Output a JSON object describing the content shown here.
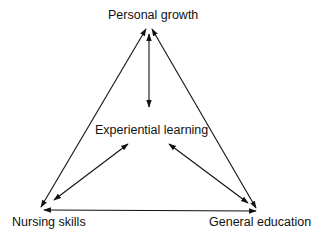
{
  "diagram": {
    "type": "triangle-relationship",
    "nodes": {
      "top": "Personal growth",
      "center": "Experiential learning",
      "bottom_left": "Nursing skills",
      "bottom_right": "General education"
    },
    "edges": [
      {
        "from": "Personal growth",
        "to": "Nursing skills",
        "style": "double-arrow"
      },
      {
        "from": "Personal growth",
        "to": "General education",
        "style": "double-arrow"
      },
      {
        "from": "Nursing skills",
        "to": "General education",
        "style": "double-arrow"
      },
      {
        "from": "Experiential learning",
        "to": "Personal growth",
        "style": "double-arrow"
      },
      {
        "from": "Experiential learning",
        "to": "Nursing skills",
        "style": "double-arrow"
      },
      {
        "from": "Experiential learning",
        "to": "General education",
        "style": "double-arrow"
      }
    ],
    "colors": {
      "line": "#111111",
      "background": "#ffffff"
    }
  }
}
